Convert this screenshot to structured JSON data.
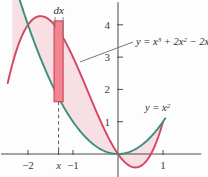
{
  "figure": {
    "background_color": "#fdfdfd"
  },
  "colors": {
    "cubic_curve": "#d64560",
    "parabola_curve": "#3a8f7d",
    "region_fill": "#f7dfe3",
    "strip_fill": "#f0868f",
    "strip_stroke": "#d64560",
    "axis": "#4a4a4a",
    "dashed_line": "#5a5a5a",
    "leader_line": "#6a6a6a",
    "text": "#2e2e2e"
  },
  "labels": {
    "dx": "dx",
    "cubic_base": "y = x",
    "cubic_exp1": "3",
    "cubic_mid": " + 2x",
    "cubic_exp2": "2",
    "cubic_tail": " − 2x",
    "cubic_full": "y = x³ + 2x² − 2x",
    "parabola_base": "y = x",
    "parabola_exp": "2",
    "parabola_full": "y = x²"
  },
  "axes": {
    "x_ticks": [
      {
        "label": "−2",
        "value": -2,
        "italic": false
      },
      {
        "label": "x",
        "value": -1.32,
        "italic": true
      },
      {
        "label": "−1",
        "value": -1,
        "italic": false
      },
      {
        "label": "1",
        "value": 1,
        "italic": false
      }
    ],
    "y_ticks": [
      {
        "label": "1",
        "value": 1
      },
      {
        "label": "2",
        "value": 2
      },
      {
        "label": "3",
        "value": 3
      },
      {
        "label": "4",
        "value": 4
      }
    ],
    "x_range": [
      -2.6,
      1.85
    ],
    "y_range": [
      -0.72,
      4.7
    ],
    "grid": false
  },
  "chart_data": {
    "type": "line",
    "xlabel": "x",
    "ylabel": "y",
    "xlim": [
      -2.6,
      1.85
    ],
    "ylim": [
      -0.72,
      4.7
    ],
    "grid": false,
    "legend_position": "inline-annotations",
    "series": [
      {
        "name": "y = x³ + 2x² − 2x",
        "color": "#d64560",
        "expression": "x^3 + 2*x^2 - 2*x",
        "x": [
          -2.45,
          -2.3,
          -2.15,
          -2.0,
          -1.85,
          -1.7,
          -1.55,
          -1.4,
          -1.25,
          -1.1,
          -0.95,
          -0.8,
          -0.65,
          -0.5,
          -0.35,
          -0.2,
          -0.05,
          0.1,
          0.25,
          0.4,
          0.55,
          0.7,
          0.85,
          1.0
        ],
        "y": [
          2.19,
          3.02,
          3.61,
          4.0,
          4.22,
          4.27,
          4.18,
          3.98,
          3.67,
          3.29,
          2.85,
          2.37,
          1.87,
          1.38,
          0.9,
          0.47,
          0.1,
          -0.18,
          -0.36,
          -0.42,
          -0.33,
          -0.08,
          0.36,
          1.0
        ]
      },
      {
        "name": "y = x²",
        "color": "#3a8f7d",
        "expression": "x^2",
        "x": [
          -2.3,
          -2.1,
          -1.9,
          -1.7,
          -1.5,
          -1.3,
          -1.1,
          -0.9,
          -0.7,
          -0.5,
          -0.3,
          -0.1,
          0.1,
          0.3,
          0.5,
          0.7,
          0.9,
          1.05
        ],
        "y": [
          5.29,
          4.41,
          3.61,
          2.89,
          2.25,
          1.69,
          1.21,
          0.81,
          0.49,
          0.25,
          0.09,
          0.01,
          0.01,
          0.09,
          0.25,
          0.49,
          0.81,
          1.1
        ]
      }
    ],
    "shaded_region": {
      "label": "area between curves",
      "fill": "#f7dfe3",
      "x_from": -2.35,
      "x_to": 1.0
    },
    "annotations": [
      {
        "text": "dx",
        "kind": "strip-width-label",
        "x": -1.32,
        "y": 4.6
      },
      {
        "text": "y = x³ + 2x² − 2x",
        "kind": "curve-label",
        "x": 0.45,
        "y": 3.55
      },
      {
        "text": "y = x²",
        "kind": "curve-label",
        "x": 0.62,
        "y": 1.45
      }
    ],
    "representative_strip": {
      "label": "dx",
      "x_center": -1.32,
      "width_x": 0.2,
      "y_bottom": 1.62,
      "y_top": 4.12,
      "fill": "#f0868f",
      "stroke": "#d64560"
    }
  }
}
